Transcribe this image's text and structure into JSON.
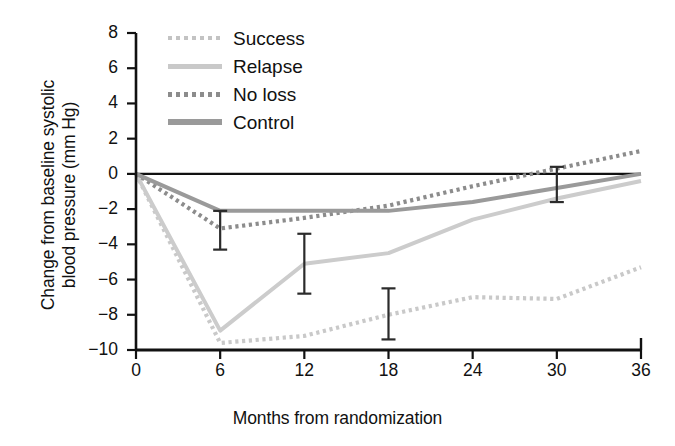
{
  "chart_data": {
    "type": "line",
    "title": "",
    "xlabel": "Months from randomization",
    "ylabel": "Change from baseline systolic\nblood pressure (mm Hg)",
    "x": [
      0,
      6,
      12,
      18,
      24,
      30,
      36
    ],
    "xticks": [
      "0",
      "6",
      "12",
      "18",
      "24",
      "30",
      "36"
    ],
    "yticks": [
      "8",
      "6",
      "4",
      "2",
      "0",
      "−2",
      "−4",
      "−6",
      "−8",
      "−10"
    ],
    "xlim": [
      0,
      36
    ],
    "ylim": [
      -10,
      8
    ],
    "grid": false,
    "legend_position": "top-left-inside",
    "zero_reference_line": true,
    "series": [
      {
        "name": "Success",
        "style": "dotted",
        "color": "#c9c9c9",
        "values": [
          0.0,
          -9.6,
          -9.2,
          -8.0,
          -7.0,
          -7.1,
          -5.3
        ]
      },
      {
        "name": "Relapse",
        "style": "solid",
        "color": "#cccccc",
        "values": [
          0.0,
          -8.9,
          -5.1,
          -4.5,
          -2.6,
          -1.4,
          -0.4
        ]
      },
      {
        "name": "No loss",
        "style": "dotted",
        "color": "#8c8c8c",
        "values": [
          0.0,
          -3.1,
          -2.5,
          -1.8,
          -0.7,
          0.3,
          1.3
        ]
      },
      {
        "name": "Control",
        "style": "solid",
        "color": "#9a9a9a",
        "values": [
          0.0,
          -2.1,
          -2.1,
          -2.1,
          -1.6,
          -0.8,
          0.0
        ]
      }
    ],
    "error_bars": [
      {
        "series": "Control",
        "x": 6,
        "y": -2.1,
        "low": -4.3,
        "high": -2.1
      },
      {
        "series": "Relapse",
        "x": 12,
        "y": -5.1,
        "low": -6.8,
        "high": -3.4
      },
      {
        "series": "Success",
        "x": 18,
        "y": -8.0,
        "low": -9.4,
        "high": -6.5
      },
      {
        "series": "Control",
        "x": 30,
        "y": -0.6,
        "low": -1.6,
        "high": 0.4
      }
    ]
  },
  "legend": {
    "items": [
      {
        "label": "Success",
        "swatch": "sw-dot-light"
      },
      {
        "label": "Relapse",
        "swatch": "sw-solid-light"
      },
      {
        "label": "No loss",
        "swatch": "sw-dot-dark"
      },
      {
        "label": "Control",
        "swatch": "sw-solid-dark"
      }
    ]
  }
}
